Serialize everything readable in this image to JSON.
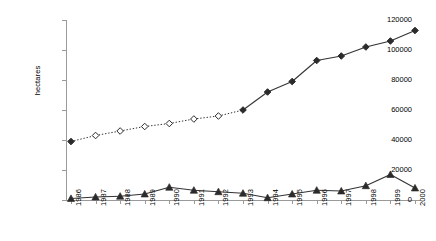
{
  "chart_data": {
    "type": "line",
    "title": "",
    "xlabel": "",
    "ylabel": "hectares",
    "categories": [
      "1986",
      "1987",
      "1988",
      "1989",
      "1990",
      "1991",
      "1992",
      "1993",
      "1994",
      "1995",
      "1996",
      "1997",
      "1998",
      "1999",
      "2000"
    ],
    "ylim": [
      0,
      120000
    ],
    "yticks": [
      0,
      20000,
      40000,
      60000,
      80000,
      100000,
      120000
    ],
    "ytick_labels": [
      "0",
      "20000",
      "40000",
      "60000",
      "80000",
      "100000",
      "120000"
    ],
    "grid": false,
    "legend": "none",
    "series": [
      {
        "name": "total area (diamond)",
        "marker": "diamond",
        "values": [
          39000,
          43000,
          46000,
          49000,
          51000,
          54000,
          56000,
          60000,
          72000,
          79000,
          93000,
          96000,
          102000,
          106000,
          113000
        ],
        "segments": [
          {
            "from": "1986",
            "to": "1993",
            "line_style": "dotted",
            "marker_fill": "hollow",
            "note": "1986 marker filled"
          },
          {
            "from": "1993",
            "to": "2000",
            "line_style": "solid",
            "marker_fill": "filled"
          }
        ]
      },
      {
        "name": "annual area (triangle)",
        "marker": "triangle",
        "line_style": "solid",
        "marker_fill": "filled",
        "values": [
          1000,
          2000,
          2500,
          4000,
          8500,
          6500,
          5500,
          4500,
          1500,
          4000,
          6500,
          6000,
          9500,
          17000,
          8000
        ]
      }
    ]
  },
  "axis": {
    "y_title": "hectares"
  }
}
